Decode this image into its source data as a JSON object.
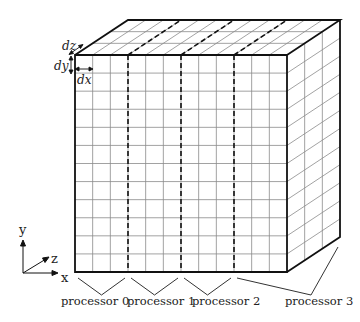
{
  "diagram": {
    "grid": {
      "columns": 12,
      "rows": 12,
      "depth_cells": 3
    },
    "spacing_labels": {
      "dx": "dx",
      "dy": "dy",
      "dz": "dz"
    },
    "axes": {
      "x": "x",
      "y": "y",
      "z": "z"
    },
    "processors": [
      {
        "label": "processor 0"
      },
      {
        "label": "processor 1"
      },
      {
        "label": "processor 2"
      },
      {
        "label": "processor 3"
      }
    ],
    "colors": {
      "outline": "#111111",
      "grid": "#8a8a8a",
      "divider": "#111111"
    }
  }
}
